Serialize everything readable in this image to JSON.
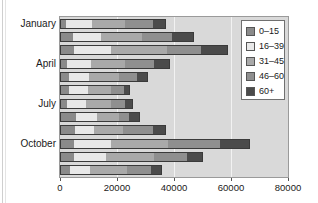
{
  "chart_data": {
    "type": "bar",
    "orientation": "horizontal",
    "stacked": true,
    "title": "",
    "xlabel": "",
    "ylabel": "",
    "xlim": [
      0,
      80000
    ],
    "x_ticks": [
      "0",
      "20000",
      "40000",
      "60000",
      "80000"
    ],
    "x_tick_values": [
      0,
      20000,
      40000,
      60000,
      80000
    ],
    "grid": "vertical",
    "legend_position": "upper right (inside)",
    "categories": [
      "January",
      "February",
      "March",
      "April",
      "May",
      "June",
      "July",
      "August",
      "September",
      "October",
      "November",
      "December"
    ],
    "visible_category_labels": [
      "January",
      "April",
      "July",
      "October"
    ],
    "series": [
      {
        "name": "0–15",
        "color": "#8a8a8a",
        "values": [
          1700,
          4100,
          4600,
          2100,
          2700,
          2700,
          2100,
          5200,
          4800,
          4600,
          4400,
          3200
        ]
      },
      {
        "name": "16–39",
        "color": "#e8e8e8",
        "values": [
          9300,
          9900,
          12800,
          8400,
          7100,
          6700,
          6600,
          7300,
          6900,
          13100,
          11400,
          7000
        ]
      },
      {
        "name": "31–45",
        "color": "#a9a9a9",
        "values": [
          11600,
          14500,
          19800,
          12100,
          10500,
          8100,
          8800,
          7800,
          10100,
          19800,
          16800,
          12800
        ]
      },
      {
        "name": "46–60",
        "color": "#8f8f8f",
        "values": [
          9600,
          10500,
          11800,
          10000,
          6500,
          4600,
          5100,
          3500,
          10400,
          18200,
          11600,
          8700
        ]
      },
      {
        "name": "60+",
        "color": "#4b4b4b",
        "values": [
          4400,
          7400,
          9200,
          5200,
          3300,
          1800,
          2400,
          3700,
          4200,
          10100,
          5400,
          3400
        ]
      }
    ],
    "totals": [
      36600,
      46400,
      58200,
      37800,
      30100,
      23900,
      25000,
      27500,
      36400,
      65800,
      49600,
      35100
    ]
  },
  "axis": {
    "y_labels": [
      {
        "text": "January",
        "row": 0
      },
      {
        "text": "April",
        "row": 3
      },
      {
        "text": "July",
        "row": 6
      },
      {
        "text": "October",
        "row": 9
      }
    ],
    "x_labels": [
      "0",
      "20000",
      "40000",
      "60000",
      "80000"
    ]
  },
  "legend": {
    "items": [
      {
        "label": "0–15",
        "color": "#8a8a8a"
      },
      {
        "label": "16–39",
        "color": "#e8e8e8"
      },
      {
        "label": "31–45",
        "color": "#a9a9a9"
      },
      {
        "label": "46–60",
        "color": "#8f8f8f"
      },
      {
        "label": "60+",
        "color": "#4b4b4b"
      }
    ]
  },
  "style": {
    "plot_background": "#d9d9d9",
    "gridline_color": "#f2f2f2",
    "bar_outline": "#3a3a3a"
  }
}
